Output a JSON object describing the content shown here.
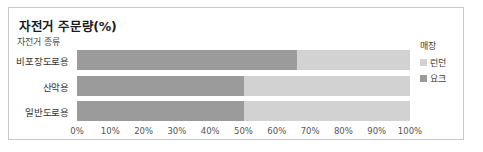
{
  "chart_data": {
    "type": "bar",
    "orientation": "horizontal",
    "stacked": true,
    "title": "자전거 주문량(%)",
    "xlabel": "",
    "ylabel": "자전거 종류",
    "categories": [
      "비포장도로용",
      "산악용",
      "일반도로용"
    ],
    "series": [
      {
        "name": "요크",
        "color": "#9b9b9b",
        "values": [
          66,
          50,
          50
        ]
      },
      {
        "name": "런던",
        "color": "#d2d2d2",
        "values": [
          34,
          50,
          50
        ]
      }
    ],
    "xlim": [
      0,
      100
    ],
    "xticks": [
      0,
      10,
      20,
      30,
      40,
      50,
      60,
      70,
      80,
      90,
      100
    ],
    "xticklabels": [
      "0%",
      "10%",
      "20%",
      "30%",
      "40%",
      "50%",
      "60%",
      "70%",
      "80%",
      "90%",
      "100%"
    ],
    "grid": false,
    "legend": {
      "title": "매장",
      "position": "right",
      "entries": [
        "런던",
        "요크"
      ]
    }
  },
  "chart": {
    "title": "자전거 주문량(%)",
    "category_axis_title": "자전거 종류",
    "rows": [
      {
        "label": "비포장도로용",
        "dark_pct": 66,
        "light_pct": 34
      },
      {
        "label": "산악용",
        "dark_pct": 50,
        "light_pct": 50
      },
      {
        "label": "일반도로용",
        "dark_pct": 50,
        "light_pct": 50
      }
    ],
    "ticks": [
      "0%",
      "10%",
      "20%",
      "30%",
      "40%",
      "50%",
      "60%",
      "70%",
      "80%",
      "90%",
      "100%"
    ],
    "legend": {
      "title": "매장",
      "items": [
        {
          "label": "런던",
          "color": "#d2d2d2"
        },
        {
          "label": "요크",
          "color": "#9b9b9b"
        }
      ]
    }
  }
}
